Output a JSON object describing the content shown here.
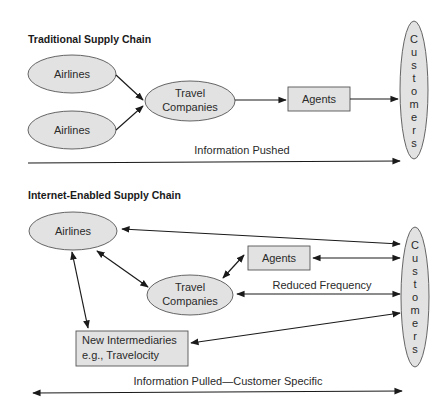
{
  "traditional": {
    "title": "Traditional Supply Chain",
    "nodes": {
      "airlines_1": "Airlines",
      "airlines_2": "Airlines",
      "travel_line1": "Travel",
      "travel_line2": "Companies",
      "agents": "Agents",
      "customers": [
        "C",
        "u",
        "s",
        "t",
        "o",
        "m",
        "e",
        "r",
        "s"
      ]
    },
    "flow_label": "Information Pushed"
  },
  "internet": {
    "title": "Internet-Enabled Supply Chain",
    "nodes": {
      "airlines": "Airlines",
      "agents": "Agents",
      "travel_line1": "Travel",
      "travel_line2": "Companies",
      "intermediaries_line1": "New Intermediaries",
      "intermediaries_line2": "e.g., Travelocity",
      "customers": [
        "C",
        "u",
        "s",
        "t",
        "o",
        "m",
        "e",
        "r",
        "s"
      ]
    },
    "edge_label": "Reduced Frequency",
    "flow_label": "Information Pulled—Customer Specific"
  },
  "colors": {
    "node_fill": "#e2e2e2",
    "stroke": "#555555",
    "arrow": "#1a1a1a"
  }
}
